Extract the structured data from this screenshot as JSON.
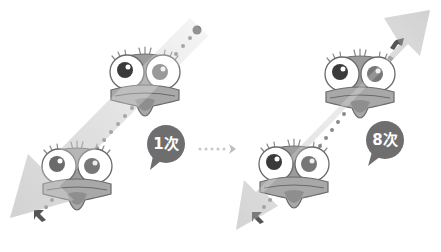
{
  "panels": [
    {
      "id": "left",
      "label": "1次",
      "arrow": "single-direction-down-left",
      "characters": 2
    },
    {
      "id": "right",
      "label": "8次",
      "arrow": "double-direction",
      "characters": 2
    }
  ],
  "connector": {
    "style": "dotted-arrow",
    "icon": "arrow-right-icon"
  },
  "colors": {
    "background": "#ffffff",
    "arrow_band": "#c8c8c8",
    "arrow_band_light": "#e6e6e6",
    "bubble": "#6e6e6e",
    "bubble_text": "#ffffff",
    "dot": "#8a8a8a",
    "face": "#9a9a9a",
    "eye_white": "#ffffff",
    "outline": "#6a6a6a"
  }
}
